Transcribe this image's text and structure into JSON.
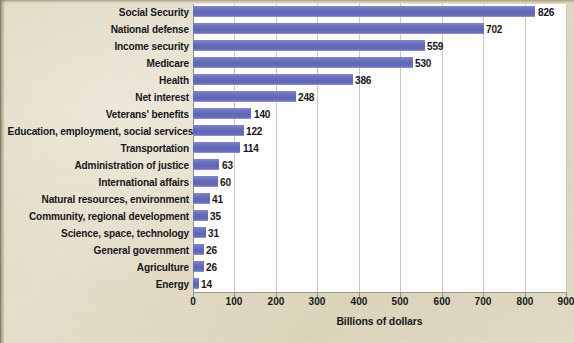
{
  "chart_data": {
    "type": "bar",
    "orientation": "horizontal",
    "title": "",
    "xlabel": "Billions of dollars",
    "ylabel": "",
    "xlim": [
      0,
      900
    ],
    "xticks": [
      0,
      100,
      200,
      300,
      400,
      500,
      600,
      700,
      800,
      900
    ],
    "grid": "vertical",
    "legend": "none",
    "categories": [
      "Social Security",
      "National defense",
      "Income security",
      "Medicare",
      "Health",
      "Net interest",
      "Veterans' benefits",
      "Education, employment, social services",
      "Transportation",
      "Administration of justice",
      "International affairs",
      "Natural resources, environment",
      "Community, regional development",
      "Science, space, technology",
      "General government",
      "Agriculture",
      "Energy"
    ],
    "values": [
      826,
      702,
      559,
      530,
      386,
      248,
      140,
      122,
      114,
      63,
      60,
      41,
      35,
      31,
      26,
      26,
      14
    ],
    "value_labels": [
      "826",
      "702",
      "559",
      "530",
      "386",
      "248",
      "140",
      "122",
      "114",
      "63",
      "60",
      "41",
      "35",
      "31",
      "26",
      "26",
      "14"
    ],
    "bar_color": "#6b70bd",
    "plot_background": "#fdfdfb",
    "page_background": "#ded6bd",
    "gridline_color": "#c9c9c4",
    "axis_color": "#8e8e88",
    "text_color": "#17171a"
  }
}
